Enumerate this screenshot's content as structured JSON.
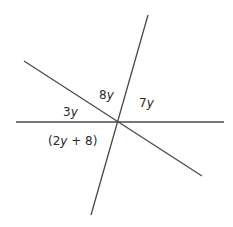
{
  "diagram": {
    "type": "intersecting-lines",
    "line_color": "#4a4a4a",
    "lines": [
      {
        "name": "horizontal-line",
        "x1": 16,
        "y1": 122,
        "x2": 224,
        "y2": 122
      },
      {
        "name": "diagonal-line",
        "x1": 24,
        "y1": 61,
        "x2": 202,
        "y2": 176
      },
      {
        "name": "steep-line",
        "x1": 148,
        "y1": 15,
        "x2": 91,
        "y2": 215
      }
    ],
    "intersection": {
      "x": 118,
      "y": 121
    },
    "angle_labels": {
      "top": {
        "coef": "8",
        "var": "y",
        "x": 99,
        "y": 99
      },
      "upper_right": {
        "coef": "7",
        "var": "y",
        "x": 139,
        "y": 107
      },
      "left": {
        "coef": "3",
        "var": "y",
        "x": 63,
        "y": 116
      },
      "lower_left": {
        "open": "(2",
        "var": "y",
        "rest": " + 8)",
        "x": 48,
        "y": 145
      }
    }
  }
}
